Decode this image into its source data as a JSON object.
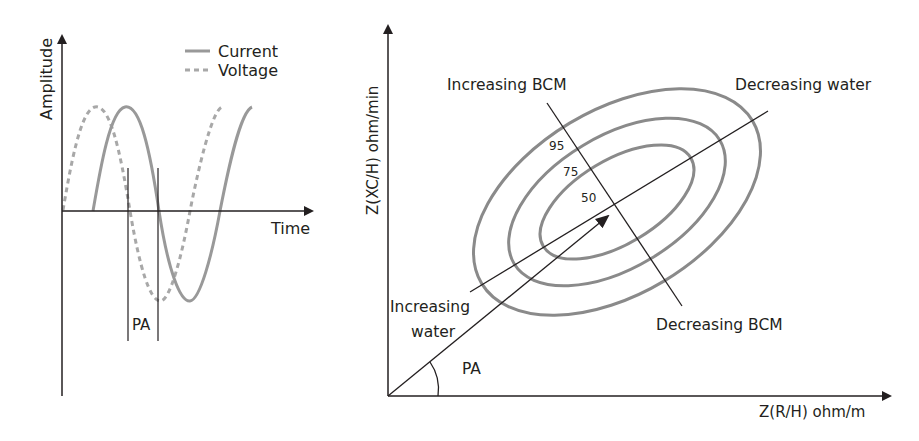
{
  "left_panel": {
    "y_label": "Amplitude",
    "x_label": "Time",
    "legend": [
      {
        "label": "Current",
        "style": "solid"
      },
      {
        "label": "Voltage",
        "style": "dashed"
      }
    ],
    "phase_label": "PA"
  },
  "right_panel": {
    "y_label": "Z(XC/H) ohm/min",
    "x_label": "Z(R/H) ohm/m",
    "annotations": {
      "increasing_bcm": "Increasing BCM",
      "decreasing_bcm": "Decreasing BCM",
      "decreasing_water": "Decreasing water",
      "increasing_water_line1": "Increasing",
      "increasing_water_line2": "water",
      "phase_angle": "PA"
    },
    "percentiles": [
      "95",
      "75",
      "50"
    ]
  },
  "colors": {
    "axis": "#231f20",
    "curve": "#8a8a8a"
  }
}
